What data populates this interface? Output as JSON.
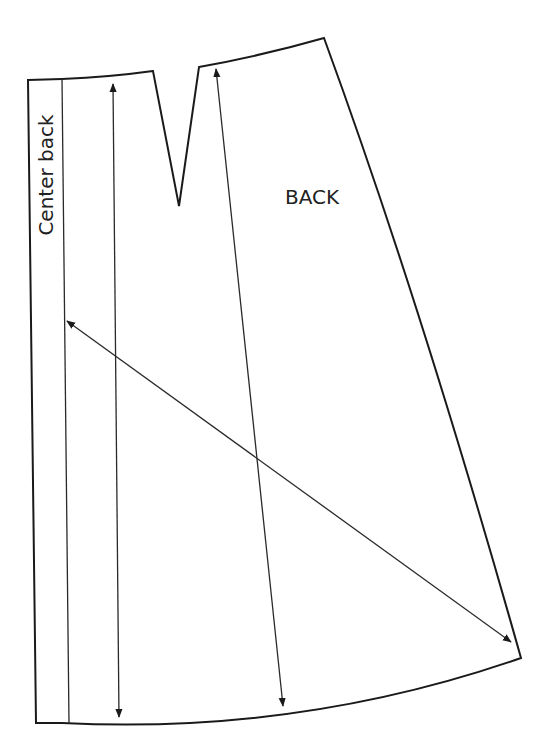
{
  "diagram": {
    "labels": {
      "piece_name": "BACK",
      "center_line": "Center back"
    },
    "colors": {
      "background": "#ffffff",
      "line": "#1a1a1a"
    },
    "elements": [
      {
        "id": "outline",
        "type": "pattern-outline"
      },
      {
        "id": "waist-dart",
        "type": "dart"
      },
      {
        "id": "center-back-line",
        "type": "fold-line"
      },
      {
        "id": "grainline-1",
        "type": "double-arrow"
      },
      {
        "id": "grainline-2",
        "type": "double-arrow"
      },
      {
        "id": "bias-line",
        "type": "double-arrow"
      }
    ]
  }
}
